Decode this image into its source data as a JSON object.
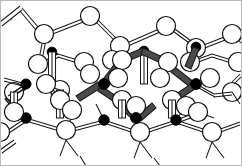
{
  "figure": {
    "width": 242,
    "height": 166,
    "background_color": "#ffffff",
    "frame": {
      "visible": true,
      "color": "#b9b9b9",
      "width": 1
    },
    "legend": {
      "open_atom_label": "open-circle atom",
      "filled_atom_label": "filled-circle atom",
      "thin_bond_label": "thin outlined bond rod",
      "thick_bond_label": "highlighted shaded bond rod"
    }
  },
  "style": {
    "open_atom_fill": "#ffffff",
    "open_atom_stroke": "#111111",
    "filled_atom_fill": "#000000",
    "bond_stroke": "#1a1a1a",
    "bond_rod_fill": "#ffffff",
    "highlight_rod_fill": "#4a4a4a"
  },
  "chart_data": {
    "type": "scatter",
    "xlabel": "",
    "ylabel": "",
    "xlim": [
      0,
      242
    ],
    "ylim": [
      0,
      166
    ],
    "grid": false,
    "legend_position": "none",
    "series": [
      {
        "name": "open-circle atoms (large)",
        "marker": "open-circle",
        "radius": 9.5,
        "points": [
          [
            29,
            152
          ],
          [
            82,
            152
          ],
          [
            136,
            152
          ],
          [
            190,
            152
          ],
          [
            14,
            122
          ],
          [
            68,
            122
          ],
          [
            122,
            122
          ],
          [
            176,
            122
          ],
          [
            228,
            122
          ],
          [
            56,
            66
          ],
          [
            110,
            66
          ],
          [
            164,
            66
          ],
          [
            218,
            66
          ],
          [
            44,
            42
          ],
          [
            98,
            42
          ],
          [
            152,
            42
          ],
          [
            206,
            42
          ],
          [
            122,
            94
          ],
          [
            68,
            94
          ],
          [
            176,
            94
          ]
        ]
      },
      {
        "name": "open-circle atoms (small)",
        "marker": "open-circle",
        "radius": 7.0,
        "points": [
          [
            46,
            93
          ],
          [
            100,
            93
          ],
          [
            154,
            93
          ],
          [
            208,
            93
          ],
          [
            34,
            73
          ],
          [
            88,
            73
          ],
          [
            142,
            73
          ],
          [
            196,
            73
          ],
          [
            120,
            53
          ],
          [
            66,
            53
          ],
          [
            174,
            53
          ],
          [
            228,
            53
          ],
          [
            12,
            53
          ]
        ]
      },
      {
        "name": "filled-circle atoms",
        "marker": "filled-circle",
        "radius": 4.6,
        "points": [
          [
            51,
            55
          ],
          [
            144,
            51
          ],
          [
            193,
            48
          ],
          [
            26,
            84
          ],
          [
            104,
            84
          ],
          [
            196,
            84
          ],
          [
            66,
            118
          ],
          [
            136,
            118
          ],
          [
            216,
            118
          ],
          [
            8,
            108
          ]
        ]
      }
    ],
    "annotations": [
      {
        "label": "highlighted ring",
        "kind": "bond-cycle",
        "vertices": [
          [
            104,
            84
          ],
          [
            122,
            60
          ],
          [
            144,
            51
          ],
          [
            196,
            84
          ],
          [
            136,
            118
          ],
          [
            122,
            100
          ]
        ]
      }
    ]
  }
}
